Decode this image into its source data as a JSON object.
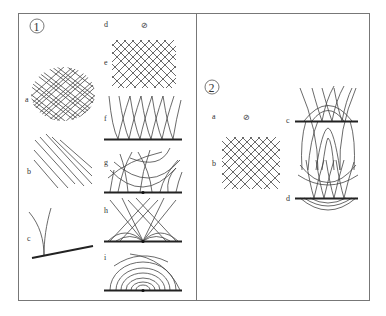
{
  "figure": {
    "panels": [
      {
        "id": "panel-1",
        "number": "1",
        "subfigures": [
          {
            "label": "a",
            "description": "dense crossed line grid"
          },
          {
            "label": "b",
            "description": "parallel diagonal lines"
          },
          {
            "label": "c",
            "description": "two curved branches meeting a sloped thick line"
          },
          {
            "label": "d",
            "description": "empty set",
            "symbol": "⊘"
          },
          {
            "label": "e",
            "description": "regular diamond cross-hatch grid"
          },
          {
            "label": "f",
            "description": "interleaved arcs rising from a thick baseline"
          },
          {
            "label": "g",
            "description": "arcs and U-curves converging on a point on baseline"
          },
          {
            "label": "h",
            "description": "crossing straight lines and arcs converging on baseline point"
          },
          {
            "label": "i",
            "description": "nested semicircular arcs over baseline point"
          }
        ]
      },
      {
        "id": "panel-2",
        "number": "2",
        "subfigures": [
          {
            "label": "a",
            "description": "empty set",
            "symbol": "⊘"
          },
          {
            "label": "b",
            "description": "diamond cross-hatch grid"
          },
          {
            "label": "c",
            "description": "arcs crossing a thick horizontal line with inverted U-curves below"
          },
          {
            "label": "d",
            "description": "arcs above thick line with nested bowl curves below"
          }
        ]
      }
    ]
  }
}
